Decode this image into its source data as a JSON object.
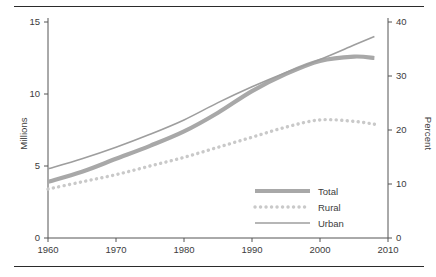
{
  "chart_data": {
    "type": "line",
    "title": "",
    "xlabel": "",
    "ylabel": "Millions",
    "ylabel_right": "Percent",
    "xlim": [
      1960,
      2010
    ],
    "ylim": [
      0,
      15
    ],
    "ylim_right": [
      0,
      40
    ],
    "grid": false,
    "legend_position": "bottom-right",
    "xticks": [
      "1960",
      "1970",
      "1980",
      "1990",
      "2000",
      "2010"
    ],
    "xtick_values": [
      1960,
      1970,
      1980,
      1990,
      2000,
      2010
    ],
    "yticks_left": [
      "0",
      "5",
      "10",
      "15"
    ],
    "ytick_values_left": [
      0,
      5,
      10,
      15
    ],
    "yticks_right": [
      "0",
      "10",
      "20",
      "30",
      "40"
    ],
    "ytick_values_right": [
      0,
      10,
      20,
      30,
      40
    ],
    "x": [
      1960,
      1965,
      1970,
      1975,
      1980,
      1985,
      1990,
      1995,
      2000,
      2005,
      2008
    ],
    "series": [
      {
        "name": "Total",
        "style": "thick-solid",
        "color": "#a8a8a8",
        "axis": "left",
        "values": [
          3.9,
          4.6,
          5.5,
          6.4,
          7.4,
          8.7,
          10.2,
          11.4,
          12.3,
          12.6,
          12.5
        ]
      },
      {
        "name": "Rural",
        "style": "dotted",
        "color": "#c9c9c9",
        "axis": "left",
        "values": [
          3.4,
          3.9,
          4.4,
          5.0,
          5.6,
          6.3,
          7.0,
          7.7,
          8.2,
          8.1,
          7.9
        ]
      },
      {
        "name": "Urban",
        "style": "thin-solid",
        "color": "#9e9e9e",
        "axis": "left",
        "values": [
          4.8,
          5.5,
          6.3,
          7.2,
          8.2,
          9.4,
          10.5,
          11.5,
          12.4,
          13.4,
          14.0
        ]
      }
    ]
  },
  "legend": {
    "items": [
      {
        "label": "Total"
      },
      {
        "label": "Rural"
      },
      {
        "label": "Urban"
      }
    ]
  },
  "colors": {
    "total": "#a8a8a8",
    "rural": "#c9c9c9",
    "urban": "#9e9e9e",
    "axis": "#555555",
    "rule": "#2b2b2b",
    "text": "#3c3c3c"
  }
}
